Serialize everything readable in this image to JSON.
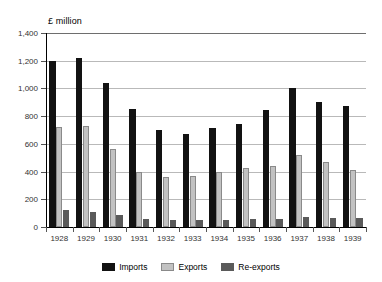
{
  "chart_data": {
    "type": "bar",
    "title": "£ million",
    "xlabel": "",
    "ylabel": "£ million",
    "ylim": [
      0,
      1400
    ],
    "ytick_step": 200,
    "grid": true,
    "legend_position": "bottom",
    "categories": [
      "1928",
      "1929",
      "1930",
      "1931",
      "1932",
      "1933",
      "1934",
      "1935",
      "1936",
      "1937",
      "1938",
      "1939"
    ],
    "series": [
      {
        "name": "Imports",
        "color": "#121212",
        "values": [
          1195,
          1220,
          1040,
          855,
          700,
          670,
          715,
          740,
          845,
          1005,
          900,
          870
        ]
      },
      {
        "name": "Exports",
        "color": "#c2c2c2",
        "values": [
          725,
          730,
          565,
          395,
          360,
          365,
          396,
          425,
          440,
          520,
          470,
          415
        ]
      },
      {
        "name": "Re-exports",
        "color": "#5a5a5a",
        "values": [
          125,
          110,
          88,
          60,
          50,
          50,
          52,
          55,
          60,
          72,
          62,
          62
        ]
      }
    ],
    "ytick_labels": [
      "0",
      "200",
      "400",
      "600",
      "800",
      "1,000",
      "1,200",
      "1,400"
    ],
    "ytick_values": [
      0,
      200,
      400,
      600,
      800,
      1000,
      1200,
      1400
    ]
  },
  "legend": {
    "items": [
      {
        "label": "Imports"
      },
      {
        "label": "Exports"
      },
      {
        "label": "Re-exports"
      }
    ]
  }
}
